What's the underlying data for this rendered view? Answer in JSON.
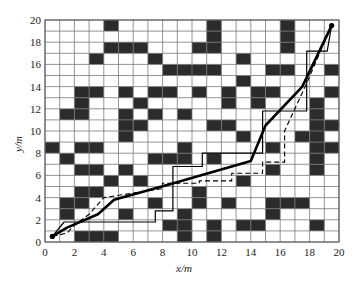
{
  "chart_data": {
    "type": "grid-path-map",
    "title": "",
    "xlabel": "x/m",
    "ylabel": "y/m",
    "xlim": [
      0,
      20
    ],
    "ylim": [
      0,
      20
    ],
    "xticks": [
      0,
      2,
      4,
      6,
      8,
      10,
      12,
      14,
      16,
      18,
      20
    ],
    "yticks": [
      0,
      2,
      4,
      6,
      8,
      10,
      12,
      14,
      16,
      18,
      20
    ],
    "grid": true,
    "cell_size": 1,
    "obstacles_note": "dark cells listed as [col,row] with origin at bottom-left",
    "obstacles": [
      [
        4,
        19
      ],
      [
        11,
        19
      ],
      [
        16,
        19
      ],
      [
        11,
        18
      ],
      [
        16,
        18
      ],
      [
        4,
        17
      ],
      [
        5,
        17
      ],
      [
        6,
        17
      ],
      [
        10,
        17
      ],
      [
        11,
        17
      ],
      [
        16,
        17
      ],
      [
        3,
        16
      ],
      [
        7,
        16
      ],
      [
        13,
        16
      ],
      [
        8,
        15
      ],
      [
        9,
        15
      ],
      [
        10,
        15
      ],
      [
        11,
        15
      ],
      [
        15,
        15
      ],
      [
        16,
        15
      ],
      [
        19,
        15
      ],
      [
        13,
        14
      ],
      [
        2,
        13
      ],
      [
        3,
        13
      ],
      [
        5,
        13
      ],
      [
        7,
        13
      ],
      [
        8,
        13
      ],
      [
        10,
        13
      ],
      [
        12,
        13
      ],
      [
        14,
        13
      ],
      [
        15,
        13
      ],
      [
        19,
        13
      ],
      [
        2,
        12
      ],
      [
        6,
        12
      ],
      [
        12,
        12
      ],
      [
        14,
        12
      ],
      [
        18,
        12
      ],
      [
        1,
        11
      ],
      [
        2,
        11
      ],
      [
        5,
        11
      ],
      [
        7,
        11
      ],
      [
        9,
        11
      ],
      [
        18,
        11
      ],
      [
        5,
        10
      ],
      [
        6,
        10
      ],
      [
        11,
        10
      ],
      [
        12,
        10
      ],
      [
        18,
        10
      ],
      [
        19,
        10
      ],
      [
        5,
        9
      ],
      [
        13,
        9
      ],
      [
        17,
        9
      ],
      [
        18,
        9
      ],
      [
        0,
        8
      ],
      [
        2,
        8
      ],
      [
        3,
        8
      ],
      [
        9,
        8
      ],
      [
        15,
        8
      ],
      [
        18,
        8
      ],
      [
        19,
        8
      ],
      [
        1,
        7
      ],
      [
        7,
        7
      ],
      [
        8,
        7
      ],
      [
        9,
        7
      ],
      [
        11,
        7
      ],
      [
        18,
        7
      ],
      [
        2,
        6
      ],
      [
        3,
        6
      ],
      [
        5,
        6
      ],
      [
        15,
        6
      ],
      [
        18,
        6
      ],
      [
        4,
        5
      ],
      [
        6,
        5
      ],
      [
        13,
        5
      ],
      [
        2,
        4
      ],
      [
        3,
        4
      ],
      [
        10,
        4
      ],
      [
        1,
        3
      ],
      [
        2,
        3
      ],
      [
        7,
        3
      ],
      [
        10,
        3
      ],
      [
        12,
        3
      ],
      [
        15,
        3
      ],
      [
        16,
        3
      ],
      [
        17,
        3
      ],
      [
        1,
        2
      ],
      [
        5,
        2
      ],
      [
        9,
        2
      ],
      [
        15,
        2
      ],
      [
        8,
        1
      ],
      [
        9,
        1
      ],
      [
        11,
        1
      ],
      [
        13,
        1
      ],
      [
        14,
        1
      ],
      [
        18,
        1
      ],
      [
        2,
        0
      ],
      [
        3,
        0
      ],
      [
        4,
        0
      ],
      [
        9,
        0
      ],
      [
        11,
        0
      ]
    ],
    "series": [
      {
        "name": "path-thick-solid",
        "style": "solid-thick",
        "points": [
          [
            0.5,
            0.5
          ],
          [
            1.5,
            1.3
          ],
          [
            3.6,
            2.5
          ],
          [
            4.7,
            3.8
          ],
          [
            8.5,
            5.2
          ],
          [
            14,
            7.3
          ],
          [
            15,
            10.5
          ],
          [
            17.5,
            14
          ],
          [
            19.5,
            19.5
          ]
        ]
      },
      {
        "name": "path-thin-solid",
        "style": "solid-thin",
        "points": [
          [
            0.5,
            0.5
          ],
          [
            1.3,
            1.8
          ],
          [
            7.5,
            1.8
          ],
          [
            7.5,
            2.8
          ],
          [
            8.7,
            2.8
          ],
          [
            8.7,
            6.8
          ],
          [
            10.7,
            6.8
          ],
          [
            10.7,
            8
          ],
          [
            14.8,
            8
          ],
          [
            14.8,
            11.8
          ],
          [
            17.8,
            11.8
          ],
          [
            17.8,
            17.2
          ],
          [
            19.2,
            17.2
          ],
          [
            19.5,
            19.5
          ]
        ]
      },
      {
        "name": "path-dashed",
        "style": "dashed",
        "points": [
          [
            0.5,
            0.5
          ],
          [
            1.5,
            0.8
          ],
          [
            2,
            1.5
          ],
          [
            3,
            2.5
          ],
          [
            4,
            4
          ],
          [
            8,
            4.8
          ],
          [
            8,
            5.3
          ],
          [
            10.5,
            5.3
          ],
          [
            10.5,
            5.5
          ],
          [
            12.7,
            5.5
          ],
          [
            12.7,
            6.2
          ],
          [
            14.8,
            6.2
          ],
          [
            14.8,
            7.2
          ],
          [
            16.3,
            7.2
          ],
          [
            16.3,
            10
          ],
          [
            17.7,
            14
          ],
          [
            19.5,
            19.5
          ]
        ]
      }
    ],
    "start_point": [
      0.5,
      0.5
    ],
    "end_point": [
      19.5,
      19.5
    ],
    "colors": {
      "obstacle": "#2b2b2b",
      "grid": "#7a7a7a",
      "path": "#000000",
      "background": "#ffffff"
    }
  },
  "axes": {
    "x_label": "x/m",
    "y_label": "y/m"
  }
}
